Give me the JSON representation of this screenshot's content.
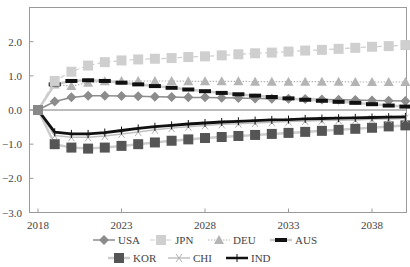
{
  "chart_data": {
    "type": "line",
    "title": "",
    "xlabel": "",
    "ylabel": "",
    "ylim": [
      -3.0,
      3.0
    ],
    "xlim": [
      2017.5,
      2040.2
    ],
    "y_ticks": [
      2.0,
      1.0,
      0.0,
      -1.0,
      -2.0,
      -3.0
    ],
    "y_tick_labels": [
      "2.0",
      "1.0",
      "0.0",
      "−1.0",
      "−2.0",
      "−3.0"
    ],
    "x_ticks": [
      2018,
      2023,
      2028,
      2033,
      2038
    ],
    "x_tick_labels": [
      "2018",
      "2023",
      "2028",
      "2033",
      "2038"
    ],
    "grid": false,
    "zero_line": true,
    "legend_position": "bottom",
    "x": [
      2018,
      2019,
      2020,
      2021,
      2022,
      2023,
      2024,
      2025,
      2026,
      2027,
      2028,
      2029,
      2030,
      2031,
      2032,
      2033,
      2034,
      2035,
      2036,
      2037,
      2038,
      2039,
      2040
    ],
    "series": [
      {
        "name": "USA",
        "marker": "diamond",
        "line": "solid",
        "color": "#8c8c8c",
        "width": 1.5,
        "values": [
          0.0,
          0.25,
          0.37,
          0.42,
          0.42,
          0.41,
          0.4,
          0.39,
          0.38,
          0.37,
          0.37,
          0.36,
          0.35,
          0.34,
          0.33,
          0.33,
          0.32,
          0.31,
          0.3,
          0.29,
          0.28,
          0.27,
          0.26
        ]
      },
      {
        "name": "JPN",
        "marker": "square",
        "line": "dashed",
        "color": "#cfcfcf",
        "width": 1.2,
        "values": [
          0.0,
          0.85,
          1.12,
          1.3,
          1.4,
          1.45,
          1.48,
          1.5,
          1.52,
          1.55,
          1.57,
          1.6,
          1.63,
          1.66,
          1.68,
          1.71,
          1.74,
          1.76,
          1.79,
          1.82,
          1.85,
          1.87,
          1.9
        ]
      },
      {
        "name": "DEU",
        "marker": "triangle",
        "line": "dotted",
        "color": "#b4b4b4",
        "width": 1.2,
        "values": [
          0.0,
          0.75,
          0.7,
          0.8,
          0.84,
          0.85,
          0.85,
          0.85,
          0.85,
          0.84,
          0.84,
          0.84,
          0.84,
          0.83,
          0.83,
          0.83,
          0.83,
          0.83,
          0.83,
          0.82,
          0.82,
          0.82,
          0.82
        ]
      },
      {
        "name": "AUS",
        "marker": "dash",
        "line": "solid",
        "color": "#cccccc",
        "width": 2.5,
        "marker_color": "#111111",
        "values": [
          0.0,
          0.75,
          0.85,
          0.87,
          0.85,
          0.8,
          0.75,
          0.7,
          0.65,
          0.6,
          0.55,
          0.5,
          0.46,
          0.42,
          0.38,
          0.34,
          0.3,
          0.27,
          0.24,
          0.21,
          0.17,
          0.13,
          0.1
        ]
      },
      {
        "name": "KOR",
        "marker": "square",
        "line": "solid",
        "color": "#cccccc",
        "width": 2.5,
        "marker_color": "#555555",
        "values": [
          0.0,
          -1.0,
          -1.1,
          -1.13,
          -1.1,
          -1.05,
          -1.0,
          -0.95,
          -0.9,
          -0.86,
          -0.82,
          -0.79,
          -0.76,
          -0.73,
          -0.7,
          -0.67,
          -0.64,
          -0.61,
          -0.58,
          -0.55,
          -0.52,
          -0.48,
          -0.45
        ]
      },
      {
        "name": "CHI",
        "marker": "x",
        "line": "solid",
        "color": "#c0c0c0",
        "width": 1.5,
        "values": [
          0.0,
          -0.75,
          -0.8,
          -0.8,
          -0.76,
          -0.7,
          -0.64,
          -0.58,
          -0.53,
          -0.49,
          -0.45,
          -0.42,
          -0.4,
          -0.38,
          -0.36,
          -0.34,
          -0.32,
          -0.31,
          -0.3,
          -0.29,
          -0.27,
          -0.26,
          -0.25
        ]
      },
      {
        "name": "IND",
        "marker": "plus",
        "line": "solid",
        "color": "#111111",
        "width": 2.8,
        "values": [
          0.0,
          -0.65,
          -0.7,
          -0.7,
          -0.66,
          -0.6,
          -0.54,
          -0.49,
          -0.45,
          -0.41,
          -0.38,
          -0.35,
          -0.33,
          -0.31,
          -0.29,
          -0.28,
          -0.26,
          -0.25,
          -0.24,
          -0.23,
          -0.22,
          -0.21,
          -0.2
        ]
      }
    ]
  },
  "legend": {
    "row1": [
      "USA",
      "JPN",
      "DEU",
      "AUS"
    ],
    "row2": [
      "KOR",
      "CHI",
      "IND"
    ]
  }
}
